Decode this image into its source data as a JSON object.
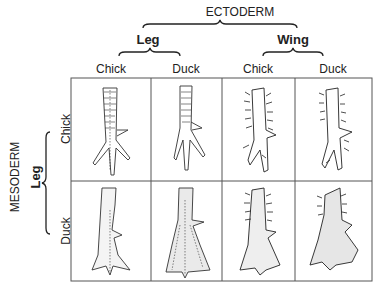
{
  "header": {
    "top_group": "ECTODERM",
    "sub_groups": [
      "Leg",
      "Wing"
    ],
    "columns": [
      "Chick",
      "Duck",
      "Chick",
      "Duck"
    ]
  },
  "side": {
    "group": "MESODERM",
    "sub_group": "Leg",
    "rows": [
      "Chick",
      "Duck"
    ]
  },
  "grid": {
    "cells": [
      [
        "chick-leg foot (chick mesoderm / chick leg ectoderm)",
        "foot (chick mesoderm / duck leg ectoderm)",
        "feathered foot (chick mesoderm / chick wing ectoderm)",
        "feathered foot (chick mesoderm / duck wing ectoderm)"
      ],
      [
        "webbed foot (duck mesoderm / chick leg ectoderm)",
        "webbed foot (duck mesoderm / duck leg ectoderm)",
        "feathered webbed foot (duck mesoderm / chick wing ectoderm)",
        "feathered webbed foot (duck mesoderm / duck wing ectoderm)"
      ]
    ]
  }
}
